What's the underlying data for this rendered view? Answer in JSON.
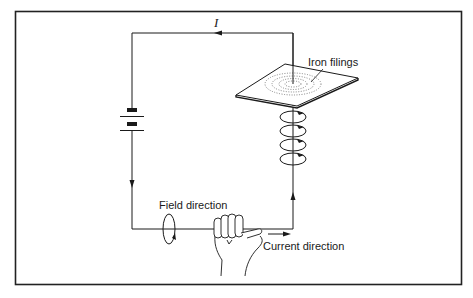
{
  "figure": {
    "labels": {
      "current_symbol": "I",
      "iron_filings": "Iron filings",
      "field_direction": "Field direction",
      "current_direction": "Current direction"
    },
    "components": [
      {
        "name": "battery",
        "type": "cell"
      },
      {
        "name": "wire-loop",
        "type": "conductor"
      },
      {
        "name": "card",
        "type": "horizontal plate with iron filings"
      },
      {
        "name": "field-loops",
        "type": "circular field lines",
        "count": 4
      },
      {
        "name": "right-hand",
        "type": "grip rule illustration"
      }
    ],
    "colors": {
      "line": "#1a1a1a",
      "background": "#ffffff",
      "frame": "#222222"
    }
  }
}
